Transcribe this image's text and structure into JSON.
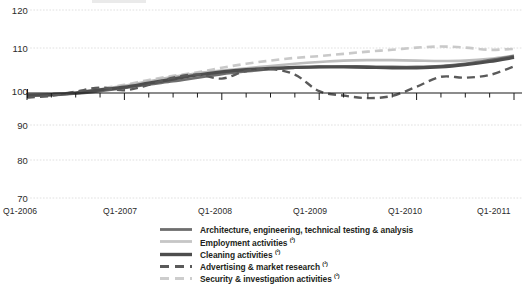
{
  "chart_data": {
    "type": "line",
    "title": "",
    "subtitle": "",
    "xlabel": "",
    "ylabel": "",
    "ylim": [
      70,
      120
    ],
    "yticks": [
      70,
      80,
      90,
      100,
      110,
      120
    ],
    "grid": true,
    "legend_position": "bottom",
    "index_base": 100,
    "x": [
      "Q1-2006",
      "Q2-2006",
      "Q3-2006",
      "Q4-2006",
      "Q1-2007",
      "Q2-2007",
      "Q3-2007",
      "Q4-2007",
      "Q1-2008",
      "Q2-2008",
      "Q3-2008",
      "Q4-2008",
      "Q1-2009",
      "Q2-2009",
      "Q3-2009",
      "Q4-2009",
      "Q1-2010",
      "Q2-2010",
      "Q3-2010",
      "Q4-2010",
      "Q1-2011"
    ],
    "xtick_labels": [
      "Q1-2006",
      "Q1-2007",
      "Q1-2008",
      "Q1-2009",
      "Q1-2010",
      "Q1-2011"
    ],
    "xtick_indices": [
      0,
      4,
      8,
      12,
      16,
      20
    ],
    "series": [
      {
        "name": "Architecture, engineering, technical testing & analysis",
        "style": "solid",
        "color": "#6e6e6e",
        "width": 2.6,
        "values": [
          99.4,
          99.3,
          99.8,
          100.4,
          101.1,
          101.9,
          102.6,
          103.4,
          104.2,
          104.8,
          105.3,
          105.6,
          105.8,
          105.9,
          105.9,
          105.8,
          105.8,
          106.0,
          106.5,
          107.3,
          108.2
        ]
      },
      {
        "name": "Employment activities (²)",
        "style": "solid",
        "color": "#bdbdbd",
        "width": 2.6,
        "values": [
          99.5,
          99.6,
          100.1,
          100.8,
          101.6,
          102.6,
          103.6,
          104.4,
          105.0,
          105.5,
          106.0,
          106.5,
          106.9,
          107.2,
          107.3,
          107.3,
          107.2,
          107.1,
          107.2,
          107.6,
          108.3
        ]
      },
      {
        "name": "Cleaning activities (²)",
        "style": "solid",
        "color": "#4d4d4d",
        "width": 3.2,
        "values": [
          99.2,
          99.5,
          100.0,
          100.7,
          101.3,
          102.2,
          103.1,
          104.0,
          104.7,
          105.2,
          105.5,
          105.7,
          105.8,
          105.8,
          105.7,
          105.6,
          105.6,
          105.8,
          106.3,
          107.0,
          107.9
        ]
      },
      {
        "name": "Advertising & market research (²)",
        "style": "dashed",
        "color": "#5a5a5a",
        "width": 2.4,
        "values": [
          98.6,
          99.1,
          100.3,
          101.2,
          100.6,
          101.8,
          103.4,
          104.1,
          103.2,
          104.9,
          105.3,
          104.1,
          100.4,
          99.2,
          98.4,
          99.1,
          101.4,
          103.6,
          103.4,
          104.0,
          105.9
        ]
      },
      {
        "name": "Security & investigation activities (²)",
        "style": "dashed",
        "color": "#c9c9c9",
        "width": 2.6,
        "values": [
          99.3,
          99.7,
          100.2,
          101.0,
          101.8,
          102.9,
          103.8,
          104.6,
          105.6,
          106.5,
          107.2,
          107.8,
          108.2,
          108.7,
          109.2,
          109.6,
          110.1,
          110.4,
          110.1,
          109.6,
          109.8
        ]
      }
    ]
  },
  "axes": {
    "y_labels": [
      "120",
      "110",
      "100",
      "90",
      "80",
      "70"
    ],
    "x_labels": [
      "Q1-2006",
      "Q1-2007",
      "Q1-2008",
      "Q1-2009",
      "Q1-2010",
      "Q1-2011"
    ]
  },
  "legend": {
    "items": [
      {
        "label": "Architecture, engineering, technical testing & analysis",
        "sup": ""
      },
      {
        "label": "Employment activities ",
        "sup": "(²)"
      },
      {
        "label": "Cleaning activities ",
        "sup": "(²)"
      },
      {
        "label": "Advertising & market research ",
        "sup": "(²)"
      },
      {
        "label": "Security & investigation activities ",
        "sup": "(²)"
      }
    ]
  },
  "colors": {
    "grid": "#d8d8d8",
    "axis": "#1a1a1a",
    "text": "#231f20",
    "background": "#ffffff"
  }
}
